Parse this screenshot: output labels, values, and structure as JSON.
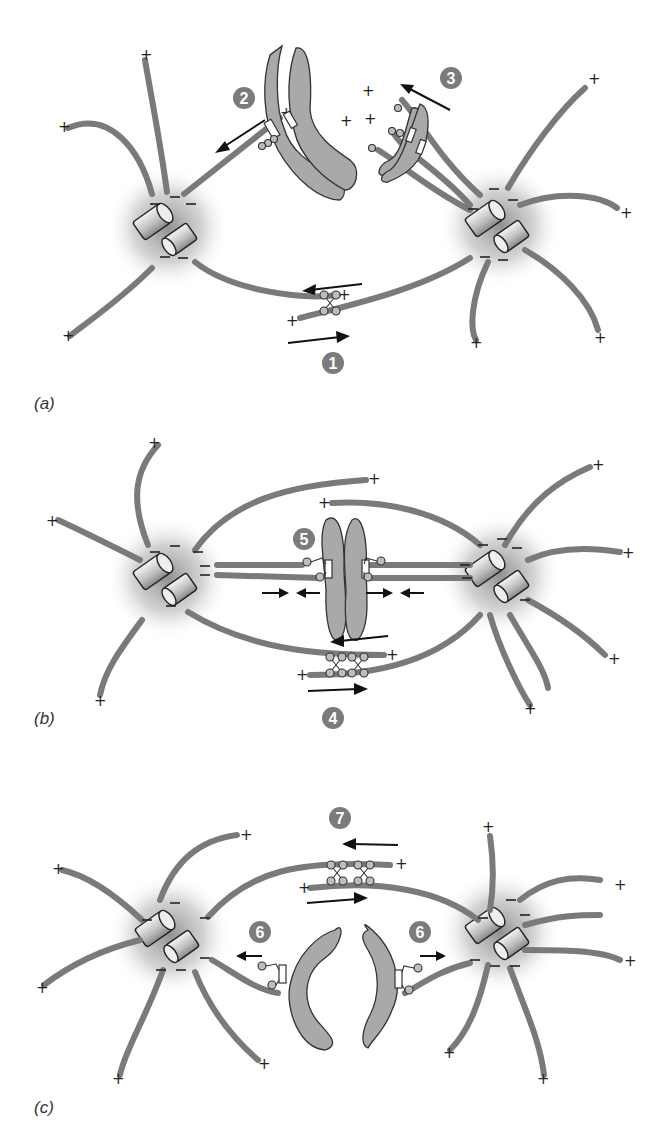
{
  "figure": {
    "top_text_cropped": "",
    "panels": [
      {
        "label": "(a)",
        "steps": [
          "1",
          "2",
          "3"
        ]
      },
      {
        "label": "(b)",
        "steps": [
          "4",
          "5"
        ]
      },
      {
        "label": "(c)",
        "steps": [
          "6",
          "6",
          "7"
        ]
      }
    ],
    "symbols": {
      "plus": "+",
      "minus": "−"
    },
    "colors": {
      "microtubule": "#7a7a7a",
      "chromosome": "#a9a9a9",
      "badge": "#7b7b7b",
      "centrosome_halo": "#9a9a9a"
    }
  }
}
